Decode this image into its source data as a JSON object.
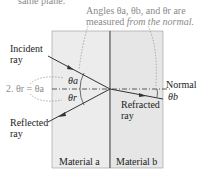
{
  "top_fragment": "same plane.",
  "annotation": {
    "line1": "Angles θa, θb, and θr are",
    "line2_prefix": "measured ",
    "line2_italic": "from the normal."
  },
  "labels": {
    "incident1": "Incident",
    "incident2": "ray",
    "reflected1": "Reflected",
    "reflected2": "ray",
    "refracted1": "Refracted",
    "refracted2": "ray",
    "normal": "Normal",
    "theta_a": "θa",
    "theta_r": "θr",
    "theta_b": "θb",
    "law": "2. θr = θa",
    "material_a": "Material a",
    "material_b": "Material b"
  },
  "colors": {
    "material_a": "#ececec",
    "material_b": "#e6e6e6",
    "annotation": "#8a8a8a",
    "line": "#333333"
  }
}
